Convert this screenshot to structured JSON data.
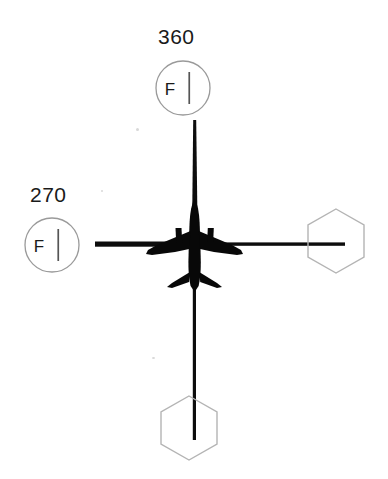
{
  "diagram": {
    "type": "aviation-navigation-display",
    "background_color": "#ffffff",
    "ink_color": "#000000",
    "symbol_outline_color": "#b0b0b0",
    "aircraft": {
      "name": "aircraft-symbol",
      "description": "twin-engine airliner planform silhouette, nose up",
      "center_x": 195,
      "center_y": 245
    },
    "crosshair": {
      "name": "course-crosshair",
      "vertical_line": {
        "x": 195,
        "y_top": 120,
        "y_bottom": 440
      },
      "horizontal_line": {
        "y": 245,
        "x_left": 95,
        "x_right": 345
      }
    },
    "fix_symbols": [
      {
        "id": "fix-north",
        "shape": "circle",
        "label": "360",
        "inner_letter": "F",
        "tick": "vertical",
        "position": "top",
        "cx": 183,
        "cy": 88,
        "r": 27
      },
      {
        "id": "fix-west",
        "shape": "circle",
        "label": "270",
        "inner_letter": "F",
        "tick": "vertical",
        "position": "left",
        "cx": 52,
        "cy": 245,
        "r": 27
      }
    ],
    "waypoint_symbols": [
      {
        "id": "waypoint-east",
        "shape": "hexagon",
        "label": "",
        "position": "right",
        "cx": 336,
        "cy": 241,
        "r": 33
      },
      {
        "id": "waypoint-south",
        "shape": "hexagon",
        "label": "",
        "position": "bottom",
        "cx": 189,
        "cy": 428,
        "r": 33
      }
    ]
  }
}
